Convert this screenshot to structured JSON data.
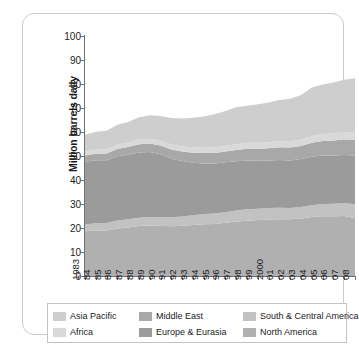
{
  "chart_data": {
    "type": "area",
    "stacked": true,
    "title": "",
    "subtitle": "",
    "xlabel": "Year",
    "ylabel": "Million barrels daily",
    "ylim": [
      0,
      100
    ],
    "yticks": [
      0,
      10,
      20,
      30,
      40,
      50,
      60,
      70,
      80,
      90,
      100
    ],
    "grid": false,
    "legend_position": "bottom",
    "x": [
      1983,
      1984,
      1985,
      1986,
      1987,
      1988,
      1989,
      1990,
      1991,
      1992,
      1993,
      1994,
      1995,
      1996,
      1997,
      1998,
      1999,
      2000,
      2001,
      2002,
      2003,
      2004,
      2005,
      2006,
      2007,
      2008
    ],
    "categories": [
      "1983",
      "84",
      "85",
      "86",
      "87",
      "88",
      "89",
      "90",
      "91",
      "92",
      "93",
      "94",
      "95",
      "96",
      "97",
      "98",
      "99",
      "2000",
      "01",
      "02",
      "03",
      "04",
      "05",
      "06",
      "07",
      "08"
    ],
    "stack_order_bottom_to_top": [
      "North America",
      "South & Central America",
      "Europe & Eurasia",
      "Middle East",
      "Africa",
      "Asia Pacific"
    ],
    "series": [
      {
        "name": "North America",
        "color": "#b0b0b0",
        "values": [
          18.6,
          19.0,
          19.0,
          19.8,
          20.2,
          20.8,
          21.0,
          20.8,
          20.7,
          20.9,
          21.2,
          21.6,
          21.7,
          22.2,
          22.7,
          23.0,
          23.3,
          23.5,
          23.6,
          23.6,
          24.0,
          24.6,
          24.9,
          24.9,
          25.0,
          24.2
        ]
      },
      {
        "name": "South & Central America",
        "color": "#c2c2c2",
        "values": [
          2.9,
          3.0,
          3.1,
          3.3,
          3.4,
          3.5,
          3.6,
          3.7,
          3.8,
          3.9,
          4.1,
          4.2,
          4.3,
          4.4,
          4.6,
          4.8,
          4.7,
          4.8,
          4.8,
          4.7,
          4.7,
          4.9,
          5.1,
          5.2,
          5.4,
          5.7
        ]
      },
      {
        "name": "Europe & Eurasia",
        "color": "#9b9b9b",
        "values": [
          26.1,
          26.2,
          26.1,
          26.8,
          26.9,
          27.2,
          27.1,
          26.2,
          24.4,
          23.1,
          21.9,
          21.1,
          20.9,
          20.8,
          20.5,
          20.3,
          20.0,
          19.8,
          19.9,
          19.8,
          20.0,
          20.2,
          20.2,
          20.1,
          20.0,
          20.3
        ]
      },
      {
        "name": "Middle East",
        "color": "#a8a8a8",
        "values": [
          2.6,
          2.7,
          2.8,
          3.0,
          3.2,
          3.4,
          3.5,
          3.7,
          3.8,
          4.0,
          4.2,
          4.3,
          4.4,
          4.5,
          4.7,
          4.9,
          5.0,
          5.1,
          5.3,
          5.4,
          5.5,
          5.8,
          6.1,
          6.3,
          6.5,
          6.7
        ]
      },
      {
        "name": "Africa",
        "color": "#d9d9d9",
        "values": [
          1.7,
          1.8,
          1.8,
          1.9,
          1.9,
          2.0,
          2.0,
          2.0,
          2.1,
          2.1,
          2.2,
          2.2,
          2.3,
          2.3,
          2.4,
          2.5,
          2.5,
          2.5,
          2.6,
          2.6,
          2.7,
          2.8,
          2.9,
          3.0,
          3.0,
          3.1
        ]
      },
      {
        "name": "Asia Pacific",
        "color": "#cecece",
        "values": [
          7.0,
          7.4,
          7.7,
          8.2,
          8.6,
          9.2,
          9.8,
          10.3,
          11.0,
          11.6,
          12.3,
          13.1,
          13.8,
          14.6,
          15.4,
          15.4,
          16.1,
          16.6,
          17.1,
          17.8,
          18.5,
          20.2,
          20.6,
          21.1,
          21.9,
          22.4
        ]
      }
    ],
    "totals": [
      58.9,
      60.1,
      60.5,
      63.0,
      64.2,
      66.1,
      67.0,
      66.7,
      65.8,
      65.6,
      65.9,
      66.5,
      67.4,
      68.8,
      70.3,
      70.9,
      71.6,
      72.3,
      73.3,
      73.9,
      75.4,
      78.5,
      79.8,
      80.6,
      81.8,
      82.4
    ],
    "legend": [
      {
        "label": "Asia Pacific",
        "color": "#cecece"
      },
      {
        "label": "Africa",
        "color": "#d9d9d9"
      },
      {
        "label": "Middle East",
        "color": "#a8a8a8"
      },
      {
        "label": "Europe & Eurasia",
        "color": "#9b9b9b"
      },
      {
        "label": "South & Central America",
        "color": "#c2c2c2"
      },
      {
        "label": "North America",
        "color": "#b0b0b0"
      }
    ]
  }
}
